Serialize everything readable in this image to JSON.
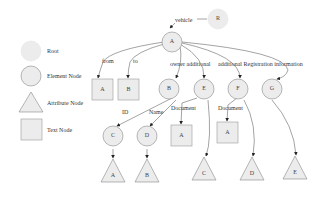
{
  "legend": {
    "items": [
      {
        "shape": "root-circle",
        "label": "Root"
      },
      {
        "shape": "element-circle",
        "label": "Element Node"
      },
      {
        "shape": "attribute-triangle",
        "label": "Attribute Node"
      },
      {
        "shape": "text-square",
        "label": "Text Node"
      }
    ]
  },
  "colors": {
    "root_fill": "#ececec",
    "node_fill": "#ececec",
    "node_stroke": "#888888",
    "edge": "#666666"
  },
  "nodes": {
    "R": "R",
    "A": "A",
    "txtA": "A",
    "txtB": "B",
    "B": "B",
    "E": "E",
    "F": "F",
    "G": "G",
    "C": "C",
    "D": "D",
    "docA1": "A",
    "docA2": "A",
    "attrA": "A",
    "attrB": "B",
    "attrC": "C",
    "attrD": "D",
    "attrE": "E"
  },
  "edges": {
    "vehicle": "vehicle",
    "from": "from",
    "to": "to",
    "owner": "owner additional",
    "additional_reg": "additional Registration information",
    "id": "ID",
    "name": "Name",
    "document1": "Document",
    "document2": "Document"
  }
}
